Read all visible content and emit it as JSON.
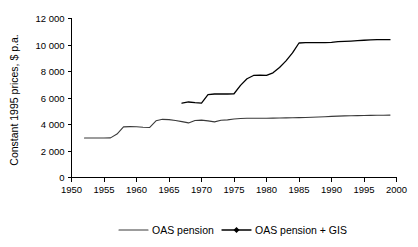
{
  "chart_data": {
    "type": "line",
    "title": "",
    "subtitle": "",
    "xlabel": "",
    "ylabel": "Constant 1995 prices, $ p.a.",
    "xlim": [
      1950,
      2000
    ],
    "ylim": [
      0,
      12000
    ],
    "grid": false,
    "legend_position": "bottom",
    "x_ticks": [
      1950,
      1955,
      1960,
      1965,
      1970,
      1975,
      1980,
      1985,
      1990,
      1995,
      2000
    ],
    "x_tick_labels": [
      "1950",
      "1955",
      "1960",
      "1965",
      "1970",
      "1975",
      "1980",
      "1985",
      "1990",
      "1995",
      "2000"
    ],
    "y_ticks": [
      0,
      2000,
      4000,
      6000,
      8000,
      10000,
      12000
    ],
    "y_tick_labels": [
      "0",
      "2 000",
      "4 000",
      "6 000",
      "8 000",
      "10 000",
      "12 000"
    ],
    "series": [
      {
        "name": "OAS pension",
        "marker": "none",
        "color": "#3a3a3a",
        "x": [
          1952,
          1953,
          1954,
          1955,
          1956,
          1957,
          1958,
          1959,
          1960,
          1961,
          1962,
          1963,
          1964,
          1965,
          1966,
          1967,
          1968,
          1969,
          1970,
          1971,
          1972,
          1973,
          1974,
          1975,
          1976,
          1977,
          1978,
          1979,
          1980,
          1981,
          1982,
          1983,
          1984,
          1985,
          1986,
          1987,
          1988,
          1989,
          1990,
          1991,
          1992,
          1993,
          1994,
          1995,
          1996,
          1997,
          1998,
          1999
        ],
        "values": [
          2980,
          2980,
          2980,
          2980,
          2990,
          3280,
          3820,
          3840,
          3830,
          3790,
          3770,
          4280,
          4390,
          4370,
          4300,
          4220,
          4120,
          4300,
          4330,
          4270,
          4200,
          4320,
          4350,
          4410,
          4450,
          4470,
          4470,
          4470,
          4470,
          4480,
          4490,
          4500,
          4510,
          4520,
          4530,
          4550,
          4570,
          4590,
          4610,
          4630,
          4650,
          4660,
          4670,
          4680,
          4690,
          4700,
          4700,
          4710
        ]
      },
      {
        "name": "OAS pension + GIS",
        "marker": "diamond",
        "color": "#000000",
        "x": [
          1967,
          1968,
          1969,
          1970,
          1971,
          1972,
          1973,
          1974,
          1975,
          1976,
          1977,
          1978,
          1979,
          1980,
          1981,
          1982,
          1983,
          1984,
          1985,
          1986,
          1987,
          1988,
          1989,
          1990,
          1991,
          1992,
          1993,
          1994,
          1995,
          1996,
          1997,
          1998,
          1999
        ],
        "values": [
          5620,
          5700,
          5650,
          5620,
          6250,
          6300,
          6300,
          6300,
          6320,
          6950,
          7450,
          7700,
          7720,
          7700,
          7900,
          8300,
          8800,
          9400,
          10150,
          10180,
          10180,
          10180,
          10180,
          10200,
          10250,
          10280,
          10300,
          10330,
          10360,
          10380,
          10400,
          10400,
          10400
        ]
      }
    ]
  },
  "legend": {
    "items": [
      {
        "label": "OAS pension",
        "style": "line"
      },
      {
        "label": "OAS pension + GIS",
        "style": "line-marker"
      }
    ]
  }
}
